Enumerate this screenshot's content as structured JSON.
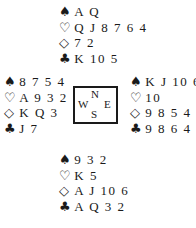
{
  "suit_symbols": {
    "spades": "♠",
    "hearts": "♡",
    "diamonds": "◇",
    "clubs": "♣"
  },
  "compass": {
    "north": "N",
    "west": "W",
    "east": "E",
    "south": "S"
  },
  "hands": {
    "north": {
      "spades": "A Q",
      "hearts": "Q J 8 7 6 4",
      "diamonds": "7 2",
      "clubs": "K 10 5"
    },
    "west": {
      "spades": "8 7 5 4",
      "hearts": "A 9 3 2",
      "diamonds": "K Q 3",
      "clubs": "J 7"
    },
    "east": {
      "spades": "K J 10 6",
      "hearts": "10",
      "diamonds": "9 8 5 4",
      "clubs": "9 8 6 4"
    },
    "south": {
      "spades": "9 3 2",
      "hearts": "K 5",
      "diamonds": "A J 10 6",
      "clubs": "A Q 3 2"
    }
  }
}
